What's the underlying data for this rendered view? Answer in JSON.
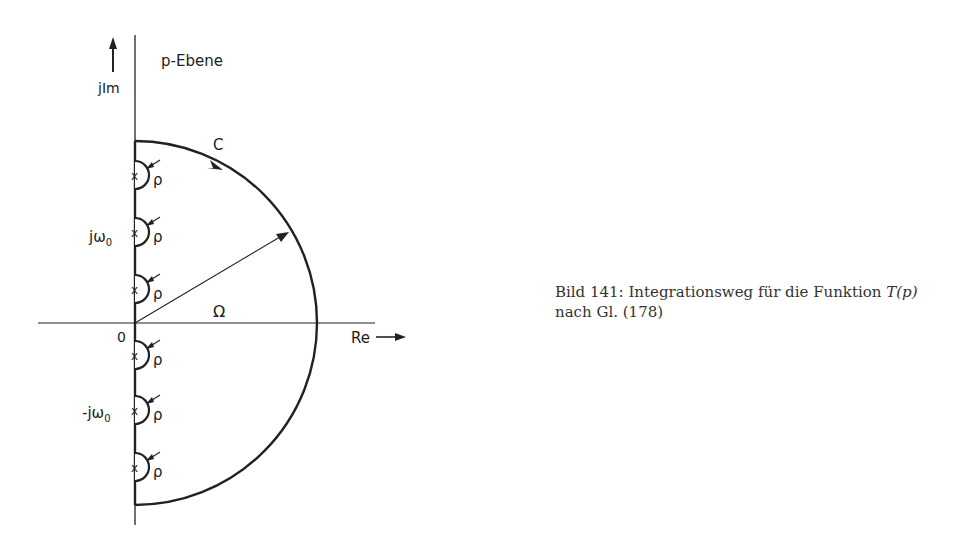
{
  "diagram": {
    "plane_label": "p-Ebene",
    "imag_axis_label": "jIm",
    "real_axis_label": "Re",
    "origin_label": "0",
    "contour_label": "C",
    "radius_label": "Ω",
    "pole_labels": {
      "positive": "jω",
      "negative": "-jω",
      "subscript": "0"
    },
    "indent_radius_label": "ρ",
    "poles": [
      175,
      232,
      289,
      355,
      410,
      467
    ],
    "origin": {
      "x": 135,
      "y": 323
    },
    "big_radius": 182,
    "indent_radius": 14
  },
  "caption": {
    "line1_prefix": "Bild 141: Integrationsweg für die Funktion ",
    "func": "T(p)",
    "line2": "nach Gl. (178)"
  }
}
